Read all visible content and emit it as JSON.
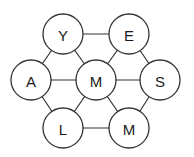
{
  "diagram": {
    "type": "hexagonal letter grid",
    "nodes": [
      {
        "id": "top-left",
        "label": "Y",
        "cx": 63,
        "cy": 34
      },
      {
        "id": "top-right",
        "label": "E",
        "cx": 129,
        "cy": 34
      },
      {
        "id": "mid-left",
        "label": "A",
        "cx": 31,
        "cy": 80
      },
      {
        "id": "center",
        "label": "M",
        "cx": 96,
        "cy": 80
      },
      {
        "id": "mid-right",
        "label": "S",
        "cx": 160,
        "cy": 80
      },
      {
        "id": "bottom-left",
        "label": "L",
        "cx": 63,
        "cy": 128
      },
      {
        "id": "bottom-right",
        "label": "M",
        "cx": 129,
        "cy": 128
      }
    ],
    "radius": 20,
    "edges": [
      [
        "top-left",
        "top-right"
      ],
      [
        "top-left",
        "mid-left"
      ],
      [
        "top-left",
        "center"
      ],
      [
        "top-right",
        "center"
      ],
      [
        "top-right",
        "mid-right"
      ],
      [
        "mid-left",
        "center"
      ],
      [
        "center",
        "mid-right"
      ],
      [
        "mid-left",
        "bottom-left"
      ],
      [
        "center",
        "bottom-left"
      ],
      [
        "center",
        "bottom-right"
      ],
      [
        "mid-right",
        "bottom-right"
      ],
      [
        "bottom-left",
        "bottom-right"
      ]
    ]
  }
}
